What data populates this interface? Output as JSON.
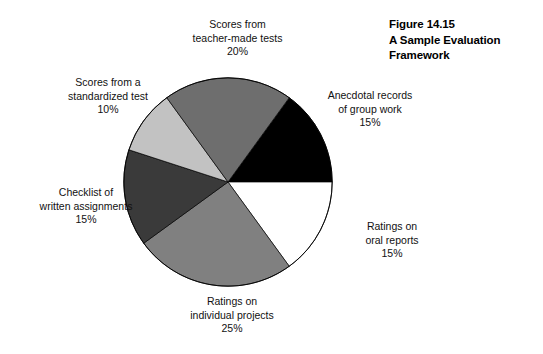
{
  "figure": {
    "caption_lines": [
      "Figure 14.15",
      "A Sample Evaluation",
      "Framework"
    ],
    "caption_line_1": "Figure 14.15",
    "caption_line_2": "A Sample Evaluation",
    "caption_line_3": "Framework"
  },
  "chart_data": {
    "type": "pie",
    "title": "A Sample Evaluation Framework",
    "labels": [
      "Anecdotal records of group work",
      "Ratings on oral reports",
      "Ratings on individual projects",
      "Checklist of written assignments",
      "Scores from a standardized test",
      "Scores from teacher-made tests"
    ],
    "values": [
      15,
      15,
      25,
      15,
      10,
      20
    ],
    "value_unit": "%",
    "start_angle_deg": 0,
    "direction": "clockwise",
    "legend": "none",
    "colors": [
      "#000000",
      "#ffffff",
      "#808080",
      "#3a3a3a",
      "#c2c2c2",
      "#6e6e6e"
    ],
    "stroke_color": "#000000",
    "slices": [
      {
        "name": "anecdotal-records",
        "line1": "Anecdotal records",
        "line2": "of group work",
        "percent": "15%",
        "value": 15,
        "color": "#000000"
      },
      {
        "name": "oral-reports",
        "line1": "Ratings on",
        "line2": "oral reports",
        "percent": "15%",
        "value": 15,
        "color": "#ffffff"
      },
      {
        "name": "individual-projects",
        "line1": "Ratings on",
        "line2": "individual projects",
        "percent": "25%",
        "value": 25,
        "color": "#808080"
      },
      {
        "name": "written-assignments",
        "line1": "Checklist of",
        "line2": "written assignments",
        "percent": "15%",
        "value": 15,
        "color": "#3a3a3a"
      },
      {
        "name": "standardized-test",
        "line1": "Scores from a",
        "line2": "standardized test",
        "percent": "10%",
        "value": 10,
        "color": "#c2c2c2"
      },
      {
        "name": "teacher-made-tests",
        "line1": "Scores from",
        "line2": "teacher-made tests",
        "percent": "20%",
        "value": 20,
        "color": "#6e6e6e"
      }
    ]
  }
}
